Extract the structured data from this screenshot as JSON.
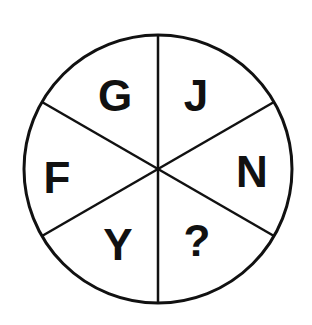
{
  "diagram": {
    "type": "letter-wheel-puzzle",
    "segments": [
      {
        "position": "top-left",
        "letter": "G"
      },
      {
        "position": "top-right",
        "letter": "J"
      },
      {
        "position": "right",
        "letter": "N"
      },
      {
        "position": "bottom-right",
        "letter": "?"
      },
      {
        "position": "bottom-left",
        "letter": "Y"
      },
      {
        "position": "left",
        "letter": "F"
      }
    ],
    "colors": {
      "stroke": "#111111",
      "background": "#ffffff"
    }
  }
}
